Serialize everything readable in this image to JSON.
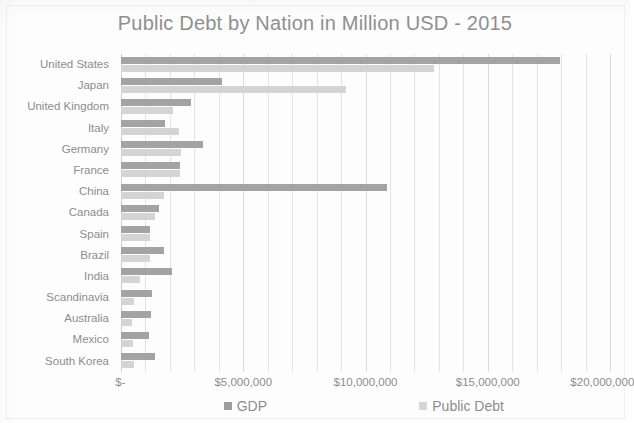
{
  "chart_data": {
    "type": "bar",
    "orientation": "horizontal",
    "title": "Public Debt by Nation in Million USD - 2015",
    "xlabel": "",
    "ylabel": "",
    "xlim": [
      0,
      20000000
    ],
    "xticks": [
      0,
      5000000,
      10000000,
      15000000,
      20000000
    ],
    "xticklabels": [
      "$-",
      "$5,000,000",
      "$10,000,000",
      "$15,000,000",
      "$20,000,000"
    ],
    "grid": true,
    "grid_axis": "x",
    "minor_gridlines": true,
    "legend_position": "bottom",
    "categories": [
      "United States",
      "Japan",
      "United Kingdom",
      "Italy",
      "Germany",
      "France",
      "China",
      "Canada",
      "Spain",
      "Brazil",
      "India",
      "Scandinavia",
      "Australia",
      "Mexico",
      "South Korea"
    ],
    "series": [
      {
        "name": "GDP",
        "color": "#a3a3a3",
        "values": [
          17947000,
          4123000,
          2849000,
          1816000,
          3356000,
          2422000,
          10866000,
          1551000,
          1199000,
          1774000,
          2074000,
          1249000,
          1224000,
          1144000,
          1377000
        ]
      },
      {
        "name": "Public Debt",
        "color": "#d4d4d4",
        "values": [
          12800000,
          9200000,
          2140000,
          2390000,
          2450000,
          2400000,
          1760000,
          1400000,
          1180000,
          1190000,
          780000,
          520000,
          440000,
          480000,
          520000
        ]
      }
    ]
  },
  "legend": {
    "items": [
      {
        "label": "GDP",
        "swatch": "dark-gray-square"
      },
      {
        "label": "Public Debt",
        "swatch": "light-gray-square"
      }
    ]
  },
  "colors": {
    "gdp": "#a3a3a3",
    "public_debt": "#d4d4d4",
    "text": "#8d8d8d",
    "gridline": "#e3e3e1",
    "background": "#fdfdfd"
  }
}
